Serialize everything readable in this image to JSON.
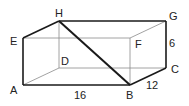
{
  "diagram": {
    "type": "rectangular-prism",
    "colors": {
      "thick_edge": "#1a1a1a",
      "thin_edge": "#8a8a8a",
      "label": "#222222"
    },
    "vertices": {
      "A": {
        "label": "A",
        "x": 23,
        "y": 85
      },
      "B": {
        "label": "B",
        "x": 130,
        "y": 85
      },
      "C": {
        "label": "C",
        "x": 166,
        "y": 68
      },
      "D": {
        "label": "D",
        "x": 59,
        "y": 68
      },
      "E": {
        "label": "E",
        "x": 23,
        "y": 38
      },
      "F": {
        "label": "F",
        "x": 130,
        "y": 38
      },
      "G": {
        "label": "G",
        "x": 166,
        "y": 21
      },
      "H": {
        "label": "H",
        "x": 59,
        "y": 21
      }
    },
    "dimensions": {
      "AB": "16",
      "BC": "12",
      "CG": "6"
    },
    "diagonal": "HB"
  }
}
